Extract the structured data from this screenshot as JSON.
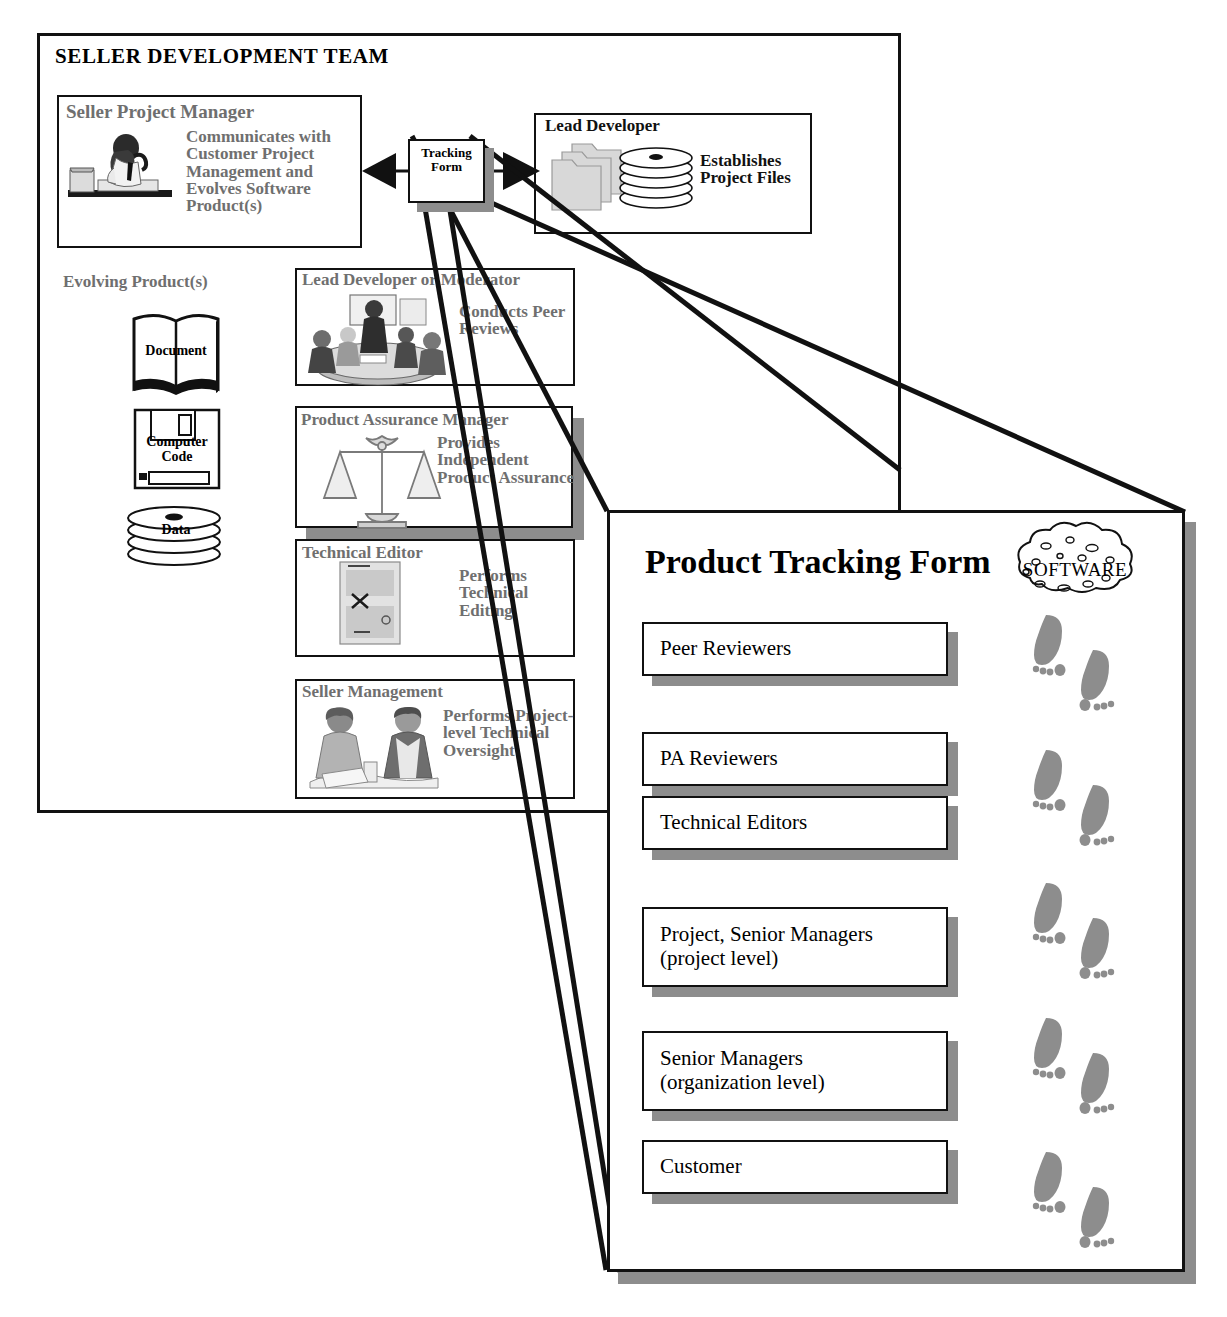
{
  "diagram": {
    "team_frame": {
      "title": "SELLER DEVELOPMENT TEAM"
    },
    "seller_project_manager": {
      "title": "Seller Project Manager",
      "description": "Communicates with Customer Project Management and Evolves  Software Product(s)",
      "icon": "person-at-desk-phone-icon"
    },
    "lead_developer": {
      "title": "Lead Developer",
      "description": "Establishes Project Files",
      "icon": "folders-and-disks-icon"
    },
    "tracking_form_node": {
      "line1": "Tracking",
      "line2": "Form"
    },
    "evolving_label": "Evolving Product(s)",
    "artifacts": [
      {
        "label": "Document",
        "icon": "open-book-icon"
      },
      {
        "label": "Computer Code",
        "icon": "floppy-disk-icon"
      },
      {
        "label": "Data",
        "icon": "disk-stack-icon"
      }
    ],
    "roles": [
      {
        "title": "Lead Developer or Moderator",
        "description": "Conducts Peer Reviews",
        "icon": "meeting-group-icon"
      },
      {
        "title": "Product Assurance Manager",
        "description": "Provides Independent Product Assurance",
        "icon": "scales-of-justice-icon"
      },
      {
        "title": "Technical Editor",
        "description": "Performs Technical Editing",
        "icon": "marked-up-page-icon"
      },
      {
        "title": "Seller Management",
        "description": "Performs Project-level Technical Oversight",
        "icon": "two-managers-icon"
      }
    ]
  },
  "tracking_form": {
    "title": "Product Tracking Form",
    "badge": "SOFTWARE",
    "badge_icon": "software-blob-icon",
    "footprints_icon": "footprints-icon",
    "rows": [
      "Peer Reviewers",
      "PA Reviewers",
      "Technical Editors",
      "Project, Senior Managers\n(project level)",
      "Senior Managers\n(organization level)",
      "Customer"
    ]
  },
  "colors": {
    "ink": "#111111",
    "gray": "#8d8d8d",
    "muted_text": "#6f6f6f",
    "paper": "#ffffff"
  }
}
